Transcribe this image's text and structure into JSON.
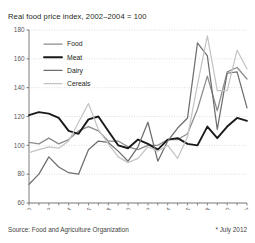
{
  "chart_title": "Real food price index, 2002–2004 = 100",
  "footer": {
    "source": "Source: Food and Agriculture Organization",
    "footnote": "* July 2012"
  },
  "colors": {
    "food": "#8c8c8e",
    "meat": "#1a1a1a",
    "dairy": "#6e6e70",
    "cereals": "#c4c4c6",
    "axis": "#6d6d6f",
    "grid": "#c9c9cb",
    "background": "#ffffff"
  },
  "legend": {
    "items": [
      {
        "label": "Food",
        "color_key": "food"
      },
      {
        "label": "Meat",
        "color_key": "meat"
      },
      {
        "label": "Dairy",
        "color_key": "dairy"
      },
      {
        "label": "Cereals",
        "color_key": "cereals"
      }
    ]
  },
  "chart_data": {
    "type": "line",
    "title": "Real food price index, 2002–2004 = 100",
    "xlabel": "",
    "ylabel": "",
    "xlim": [
      1990,
      2012
    ],
    "ylim": [
      60,
      180
    ],
    "ytick_step": 20,
    "yticks": [
      60,
      80,
      100,
      120,
      140,
      160,
      180
    ],
    "grid": true,
    "grid_axis": "y",
    "legend_position": "top-left-inside",
    "x": [
      1990,
      1991,
      1992,
      1993,
      1994,
      1995,
      1996,
      1997,
      1998,
      1999,
      2000,
      2001,
      2002,
      2003,
      2004,
      2005,
      2006,
      2007,
      2008,
      2009,
      2010,
      2011,
      2012
    ],
    "xtick_labels": [
      "1990",
      "1992",
      "1994",
      "1996",
      "1998",
      "2000",
      "2002",
      "2004",
      "2006",
      "2008",
      "2010",
      "2012*"
    ],
    "xtick_values": [
      1990,
      1992,
      1994,
      1996,
      1998,
      2000,
      2002,
      2004,
      2006,
      2008,
      2010,
      2012
    ],
    "series": [
      {
        "name": "Food",
        "color_key": "food",
        "values": [
          102,
          101,
          105,
          101,
          104,
          110,
          113,
          110,
          103,
          103,
          99,
          97,
          100,
          100,
          104,
          104,
          108,
          125,
          148,
          124,
          151,
          154,
          146
        ]
      },
      {
        "name": "Meat",
        "color_key": "meat",
        "values": [
          121,
          123,
          122,
          119,
          110,
          108,
          118,
          120,
          110,
          100,
          98,
          104,
          101,
          97,
          104,
          105,
          101,
          100,
          113,
          105,
          113,
          119,
          117
        ]
      },
      {
        "name": "Dairy",
        "color_key": "dairy",
        "values": [
          73,
          80,
          92,
          85,
          81,
          80,
          97,
          103,
          102,
          96,
          89,
          99,
          116,
          89,
          103,
          112,
          119,
          171,
          162,
          111,
          150,
          151,
          126
        ]
      },
      {
        "name": "Cereals",
        "color_key": "cereals",
        "values": [
          95,
          97,
          99,
          98,
          103,
          116,
          129,
          111,
          101,
          92,
          88,
          91,
          99,
          96,
          100,
          91,
          106,
          142,
          176,
          138,
          138,
          166,
          153
        ]
      }
    ]
  }
}
